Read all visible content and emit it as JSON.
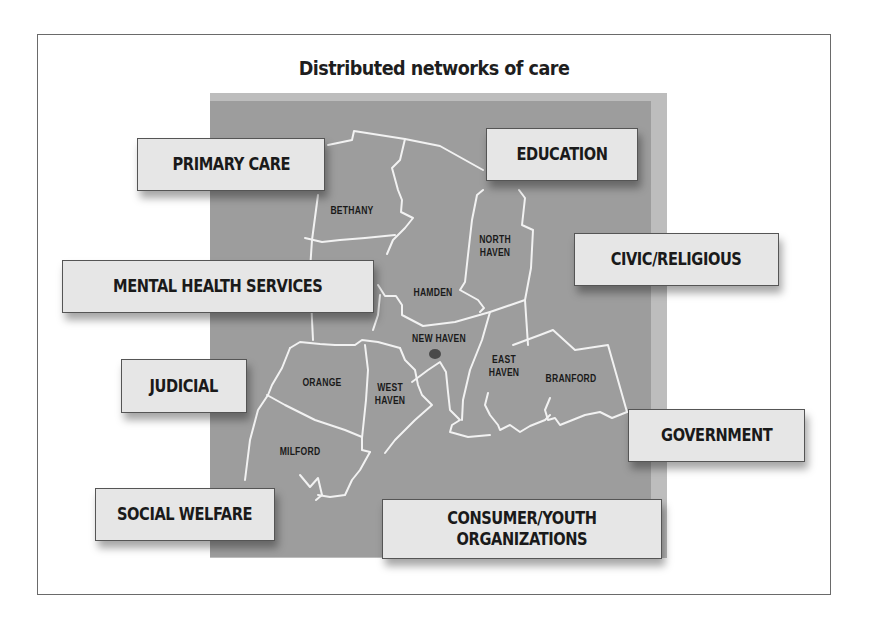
{
  "diagram": {
    "title": "Distributed networks of care",
    "colors": {
      "map_fill": "#9d9d9d",
      "map_edge": "#bdbdbd",
      "label_fill": "#e6e6e6",
      "border_lines": "#f2f2f2",
      "new_haven_marker": "#4a4a4a"
    },
    "towns": {
      "bethany": "BETHANY",
      "north_haven_1": "NORTH",
      "north_haven_2": "HAVEN",
      "hamden": "HAMDEN",
      "new_haven": "NEW HAVEN",
      "east_haven_1": "EAST",
      "east_haven_2": "HAVEN",
      "branford": "BRANFORD",
      "orange": "ORANGE",
      "west_haven_1": "WEST",
      "west_haven_2": "HAVEN",
      "milford": "MILFORD"
    },
    "sectors": {
      "primary_care": "PRIMARY CARE",
      "education": "EDUCATION",
      "civic_religious": "CIVIC/RELIGIOUS",
      "mental_health": "MENTAL HEALTH SERVICES",
      "judicial": "JUDICIAL",
      "government": "GOVERNMENT",
      "social_welfare": "SOCIAL WELFARE",
      "consumer_youth_1": "CONSUMER/YOUTH",
      "consumer_youth_2": "ORGANIZATIONS"
    }
  }
}
